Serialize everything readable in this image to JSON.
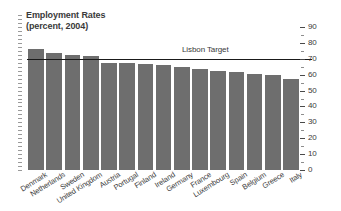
{
  "chart_data": {
    "type": "bar",
    "title": "Employment Rates",
    "subtitle": "(percent, 2004)",
    "xlabel": "",
    "ylabel": "",
    "ylim": [
      0,
      90
    ],
    "y_ticks": [
      0,
      10,
      20,
      30,
      40,
      50,
      60,
      70,
      80,
      90
    ],
    "y_axis_position": "right",
    "grid": false,
    "legend": "none",
    "categories": [
      "Denmark",
      "Netherlands",
      "Sweden",
      "United Kingdom",
      "Austria",
      "Portugal",
      "Finland",
      "Ireland",
      "Germany",
      "France",
      "Luxembourg",
      "Spain",
      "Belgium",
      "Greece",
      "Italy"
    ],
    "values": [
      76,
      73.5,
      72.5,
      72,
      67.5,
      67.5,
      67,
      66,
      65,
      63.5,
      62.5,
      61.5,
      60.5,
      59.5,
      57.5
    ],
    "annotations": [
      {
        "name": "lisbon-target",
        "label": "Lisbon Target",
        "value": 70,
        "type": "horizontal-line"
      }
    ],
    "colors": {
      "bar": "#6e6e6e",
      "target_line": "#1a1a1a",
      "text": "#3a3a3a",
      "background": "#ffffff"
    }
  }
}
